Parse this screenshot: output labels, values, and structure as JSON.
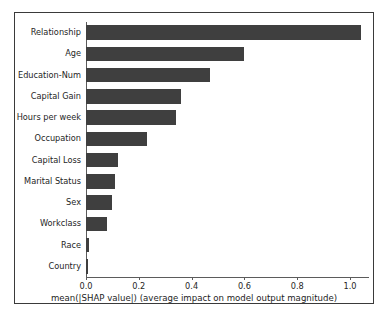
{
  "chart_data": {
    "type": "bar",
    "orientation": "horizontal",
    "title": "",
    "xlabel": "mean(|SHAP value|) (average impact on model output magnitude)",
    "ylabel": "",
    "categories": [
      "Relationship",
      "Age",
      "Education-Num",
      "Capital Gain",
      "Hours per week",
      "Occupation",
      "Capital Loss",
      "Marital Status",
      "Sex",
      "Workclass",
      "Race",
      "Country"
    ],
    "values": [
      1.04,
      0.6,
      0.47,
      0.36,
      0.34,
      0.23,
      0.12,
      0.11,
      0.1,
      0.08,
      0.012,
      0.006
    ],
    "xlim": [
      0.0,
      1.068
    ],
    "xticks": [
      0.0,
      0.2,
      0.4,
      0.6,
      0.8,
      1.0
    ],
    "xtick_labels": [
      "0.0",
      "0.2",
      "0.4",
      "0.6",
      "0.8",
      "1.0"
    ],
    "grid": false,
    "legend": null,
    "bar_color": "#3f3f3f",
    "axis_color": "#5b5b5b",
    "frame_color": "#3a3a3a",
    "background_color": "#ffffff"
  }
}
